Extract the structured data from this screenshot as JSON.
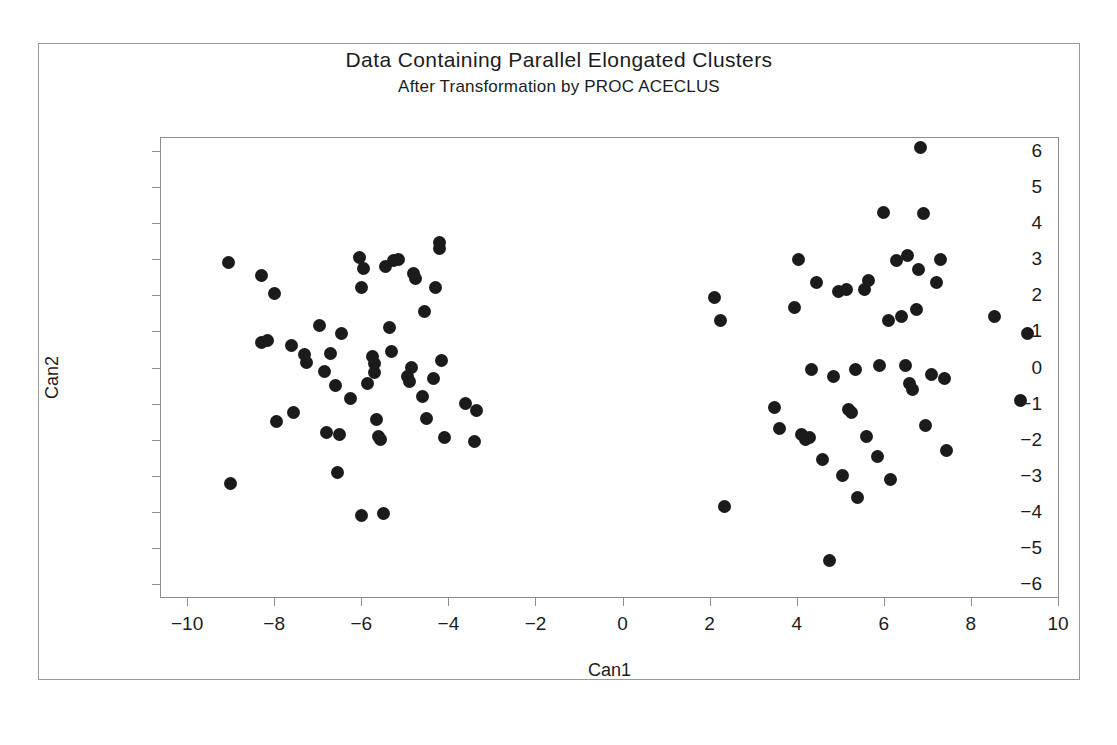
{
  "figure": {
    "title": "Data Containing Parallel Elongated Clusters",
    "subtitle": "After Transformation by PROC ACECLUS",
    "background_color": "#ffffff",
    "frame_color": "#8d8d8d",
    "marker_color": "#1b1b1b"
  },
  "chart_data": {
    "type": "scatter",
    "title": "Data Containing Parallel Elongated Clusters",
    "subtitle": "After Transformation by PROC ACECLUS",
    "xlabel": "Can1",
    "ylabel": "Can2",
    "xlim": [
      -10.6,
      10.0
    ],
    "ylim": [
      -6.35,
      6.35
    ],
    "xticks": [
      -10,
      -8,
      -6,
      -4,
      -2,
      0,
      2,
      4,
      6,
      8,
      10
    ],
    "xticklabels": [
      "-10",
      "-8",
      "-6",
      "-4",
      "-2",
      "0",
      "2",
      "4",
      "6",
      "8",
      "10"
    ],
    "yticks": [
      -6,
      -5,
      -4,
      -3,
      -2,
      -1,
      0,
      1,
      2,
      3,
      4,
      5,
      6
    ],
    "yticklabels": [
      "-6",
      "-5",
      "-4",
      "-3",
      "-2",
      "-1",
      "0",
      "1",
      "2",
      "3",
      "4",
      "5",
      "6"
    ],
    "grid": false,
    "legend": null,
    "marker": "filled-circle",
    "marker_size_px": 13,
    "series": [
      {
        "name": "Cluster 1 (left)",
        "color": "#1b1b1b",
        "points": [
          [
            -9.05,
            2.9
          ],
          [
            -9.0,
            -3.2
          ],
          [
            -8.3,
            2.55
          ],
          [
            -8.3,
            0.7
          ],
          [
            -8.15,
            0.75
          ],
          [
            -8.0,
            2.05
          ],
          [
            -7.95,
            -1.5
          ],
          [
            -7.6,
            0.6
          ],
          [
            -7.55,
            -1.25
          ],
          [
            -7.3,
            0.35
          ],
          [
            -7.25,
            0.15
          ],
          [
            -6.95,
            1.15
          ],
          [
            -6.85,
            -0.1
          ],
          [
            -6.8,
            -1.8
          ],
          [
            -6.7,
            0.4
          ],
          [
            -6.6,
            -0.5
          ],
          [
            -6.55,
            -2.9
          ],
          [
            -6.5,
            -1.85
          ],
          [
            -6.45,
            0.95
          ],
          [
            -6.25,
            -0.85
          ],
          [
            -6.05,
            3.05
          ],
          [
            -6.0,
            2.2
          ],
          [
            -6.0,
            -4.1
          ],
          [
            -5.95,
            2.75
          ],
          [
            -5.85,
            -0.45
          ],
          [
            -5.75,
            0.3
          ],
          [
            -5.7,
            0.1
          ],
          [
            -5.7,
            -0.15
          ],
          [
            -5.65,
            -1.45
          ],
          [
            -5.6,
            -1.9
          ],
          [
            -5.55,
            -2.0
          ],
          [
            -5.5,
            -4.05
          ],
          [
            -5.45,
            2.8
          ],
          [
            -5.35,
            1.1
          ],
          [
            -5.3,
            0.45
          ],
          [
            -5.25,
            2.95
          ],
          [
            -5.15,
            3.0
          ],
          [
            -4.95,
            -0.25
          ],
          [
            -4.9,
            -0.4
          ],
          [
            -4.85,
            0.0
          ],
          [
            -4.8,
            2.6
          ],
          [
            -4.75,
            2.45
          ],
          [
            -4.6,
            -0.8
          ],
          [
            -4.55,
            1.55
          ],
          [
            -4.5,
            -1.4
          ],
          [
            -4.35,
            -0.3
          ],
          [
            -4.3,
            2.2
          ],
          [
            -4.2,
            3.45
          ],
          [
            -4.2,
            3.3
          ],
          [
            -4.15,
            0.2
          ],
          [
            -4.1,
            -1.95
          ],
          [
            -3.6,
            -1.0
          ],
          [
            -3.4,
            -2.05
          ],
          [
            -3.35,
            -1.2
          ]
        ]
      },
      {
        "name": "Cluster 2 (right)",
        "color": "#1b1b1b",
        "points": [
          [
            2.1,
            1.95
          ],
          [
            2.25,
            1.3
          ],
          [
            2.35,
            -3.85
          ],
          [
            3.5,
            -1.1
          ],
          [
            3.6,
            -1.7
          ],
          [
            3.95,
            1.65
          ],
          [
            4.05,
            3.0
          ],
          [
            4.1,
            -1.85
          ],
          [
            4.2,
            -2.0
          ],
          [
            4.3,
            -1.95
          ],
          [
            4.35,
            -0.05
          ],
          [
            4.45,
            2.35
          ],
          [
            4.6,
            -2.55
          ],
          [
            4.75,
            -5.35
          ],
          [
            4.85,
            -0.25
          ],
          [
            4.95,
            2.1
          ],
          [
            5.05,
            -3.0
          ],
          [
            5.15,
            2.15
          ],
          [
            5.2,
            -1.15
          ],
          [
            5.25,
            -1.25
          ],
          [
            5.35,
            -0.05
          ],
          [
            5.4,
            -3.6
          ],
          [
            5.55,
            2.15
          ],
          [
            5.6,
            -1.9
          ],
          [
            5.65,
            2.4
          ],
          [
            5.85,
            -2.45
          ],
          [
            5.9,
            0.05
          ],
          [
            6.0,
            4.3
          ],
          [
            6.1,
            1.3
          ],
          [
            6.15,
            -3.1
          ],
          [
            6.3,
            2.95
          ],
          [
            6.4,
            1.4
          ],
          [
            6.5,
            0.05
          ],
          [
            6.55,
            3.1
          ],
          [
            6.6,
            -0.45
          ],
          [
            6.65,
            -0.6
          ],
          [
            6.75,
            1.6
          ],
          [
            6.8,
            2.7
          ],
          [
            6.85,
            6.1
          ],
          [
            6.9,
            4.25
          ],
          [
            6.95,
            -1.6
          ],
          [
            7.1,
            -0.2
          ],
          [
            7.2,
            2.35
          ],
          [
            7.3,
            3.0
          ],
          [
            7.4,
            -0.3
          ],
          [
            7.45,
            -2.3
          ],
          [
            8.55,
            1.4
          ],
          [
            9.15,
            -0.9
          ],
          [
            9.3,
            0.95
          ]
        ]
      }
    ]
  }
}
